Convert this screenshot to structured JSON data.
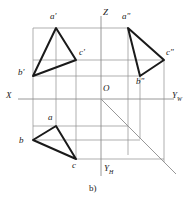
{
  "figure": {
    "caption": "b)",
    "axes": {
      "x_label": "X",
      "z_label": "Z",
      "origin_label": "O",
      "yw_label": "Y",
      "yw_sub": "W",
      "yh_label": "Y",
      "yh_sub": "H"
    },
    "colors": {
      "object_line": "#1a1a1a",
      "projection_line": "#8c8c8c",
      "axis_line": "#8c8c8c",
      "background": "#ffffff"
    },
    "projections": {
      "frontal": {
        "name": "frontal-projection",
        "vertices": [
          {
            "label": "a'",
            "x": 56,
            "y": 28,
            "label_x": 50,
            "label_y": 12
          },
          {
            "label": "b'",
            "x": 33,
            "y": 76,
            "label_x": 18,
            "label_y": 68
          },
          {
            "label": "c'",
            "x": 76,
            "y": 60,
            "label_x": 79,
            "label_y": 48
          }
        ]
      },
      "profile": {
        "name": "profile-projection",
        "vertices": [
          {
            "label": "a\"",
            "x": 128,
            "y": 28,
            "label_x": 122,
            "label_y": 12
          },
          {
            "label": "b\"",
            "x": 140,
            "y": 76,
            "label_x": 136,
            "label_y": 76
          },
          {
            "label": "c\"",
            "x": 164,
            "y": 60,
            "label_x": 166,
            "label_y": 48
          }
        ]
      },
      "horizontal": {
        "name": "horizontal-projection",
        "vertices": [
          {
            "label": "a",
            "x": 56,
            "y": 126,
            "label_x": 48,
            "label_y": 113
          },
          {
            "label": "b",
            "x": 33,
            "y": 140,
            "label_x": 19,
            "label_y": 136
          },
          {
            "label": "c",
            "x": 76,
            "y": 159,
            "label_x": 72,
            "label_y": 161
          }
        ]
      }
    },
    "geometry": {
      "origin": {
        "x": 101,
        "y": 99
      },
      "x_axis": {
        "x1": 18,
        "y1": 99,
        "x2": 101,
        "y2": 99
      },
      "yw_axis": {
        "x1": 101,
        "y1": 99,
        "x2": 174,
        "y2": 99
      },
      "z_axis": {
        "x1": 101,
        "y1": 16,
        "x2": 101,
        "y2": 99
      },
      "yh_axis": {
        "x1": 101,
        "y1": 99,
        "x2": 101,
        "y2": 176
      },
      "y_diagonal": {
        "x1": 101,
        "y1": 99,
        "x2": 176,
        "y2": 174
      }
    }
  }
}
